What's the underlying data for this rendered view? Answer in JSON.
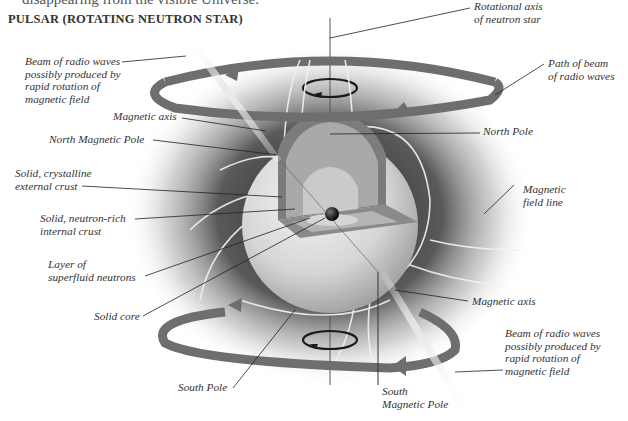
{
  "page": {
    "clipped_top_line": "disappearing from the visible Universe.",
    "heading": "PULSAR (ROTATING NEUTRON STAR)"
  },
  "colors": {
    "background": "#ffffff",
    "ring": "#6e6e6e",
    "glow": "#3a3a3a",
    "star_surface": "#d8d8d8",
    "crust_outer": "#7a7a7a",
    "crust_inner": "#a8a8a8",
    "superfluid": "#c4c4c4",
    "core": "#111111",
    "text": "#333333"
  },
  "labels": {
    "rotational_axis": [
      "Rotational axis",
      "of neutron star"
    ],
    "beam_top": [
      "Beam of radio waves",
      "possibly produced by",
      "rapid rotation of",
      "magnetic field"
    ],
    "path_of_beam": [
      "Path of beam",
      "of radio waves"
    ],
    "magnetic_axis_top": [
      "Magnetic axis"
    ],
    "north_magnetic_pole": [
      "North Magnetic Pole"
    ],
    "north_pole": [
      "North Pole"
    ],
    "external_crust": [
      "Solid, crystalline",
      "external crust"
    ],
    "magnetic_field_line": [
      "Magnetic",
      "field line"
    ],
    "internal_crust": [
      "Solid, neutron-rich",
      "internal crust"
    ],
    "superfluid_layer": [
      "Layer of",
      "superfluid neutrons"
    ],
    "magnetic_axis_bottom": [
      "Magnetic axis"
    ],
    "solid_core": [
      "Solid core"
    ],
    "beam_bottom": [
      "Beam of radio waves",
      "possibly produced by",
      "rapid rotation of",
      "magnetic field"
    ],
    "south_pole": [
      "South Pole"
    ],
    "south_magnetic_pole": [
      "South",
      "Magnetic Pole"
    ]
  },
  "icons": {
    "rotation_arrow_top": "counterclockwise-rotation-arrow",
    "rotation_arrow_bottom": "counterclockwise-rotation-arrow",
    "beam_direction_arrows": "ring-arrowheads"
  }
}
